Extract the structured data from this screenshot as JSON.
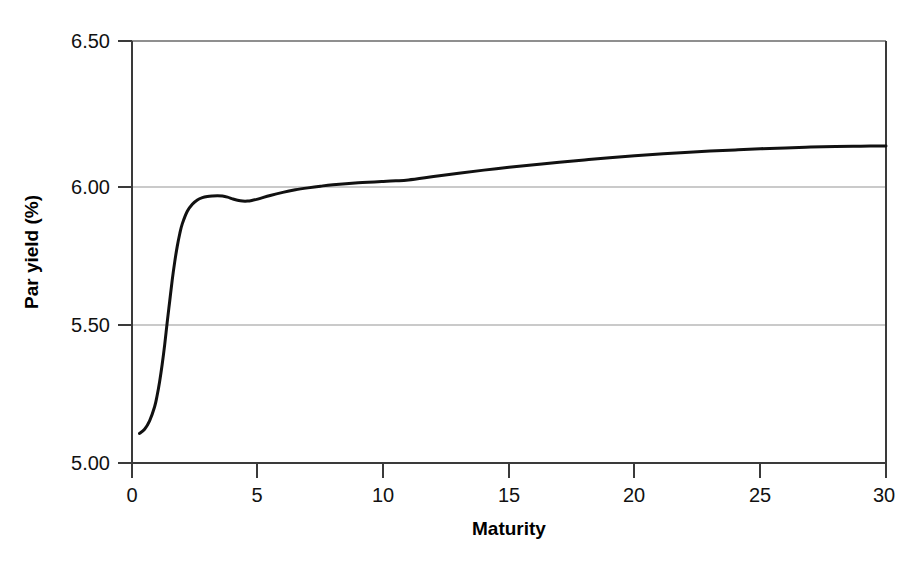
{
  "chart_data": {
    "type": "line",
    "title": "",
    "xlabel": "Maturity",
    "ylabel": "Par yield (%)",
    "xlim": [
      0,
      30
    ],
    "ylim": [
      5.0,
      6.5
    ],
    "xticks": [
      0,
      5,
      10,
      15,
      20,
      25,
      30
    ],
    "xtick_labels": [
      "0",
      "5",
      "10",
      "15",
      "20",
      "25",
      "30"
    ],
    "yticks": [
      5.0,
      5.5,
      6.0,
      6.5
    ],
    "ytick_labels": [
      "5.00",
      "5.50",
      "6.00",
      "6.50"
    ],
    "grid": "horizontal",
    "gridlines_at": [
      5.5,
      6.0
    ],
    "legend": "none",
    "line_color": "#111111",
    "line_width": 3,
    "series": [
      {
        "name": "Par yield curve",
        "x": [
          0.3,
          0.5,
          0.7,
          0.9,
          1.0,
          1.1,
          1.2,
          1.3,
          1.4,
          1.5,
          1.6,
          1.7,
          1.8,
          1.9,
          2.0,
          2.2,
          2.4,
          2.6,
          2.8,
          3.0,
          3.2,
          3.4,
          3.6,
          3.8,
          4.0,
          4.2,
          4.4,
          4.6,
          4.8,
          5.0,
          5.5,
          6.0,
          6.5,
          7.0,
          7.5,
          8.0,
          9.0,
          10.0,
          10.5,
          11.0,
          12.0,
          13.0,
          14.0,
          15.0,
          16.0,
          17.0,
          18.0,
          19.0,
          20.0,
          21.0,
          22.0,
          23.0,
          24.0,
          25.0,
          26.0,
          27.0,
          28.0,
          29.0,
          30.0
        ],
        "y": [
          5.105,
          5.12,
          5.15,
          5.2,
          5.24,
          5.29,
          5.35,
          5.42,
          5.5,
          5.575,
          5.65,
          5.715,
          5.77,
          5.815,
          5.85,
          5.895,
          5.92,
          5.935,
          5.943,
          5.947,
          5.949,
          5.95,
          5.949,
          5.945,
          5.939,
          5.934,
          5.931,
          5.931,
          5.934,
          5.938,
          5.951,
          5.962,
          5.971,
          5.978,
          5.984,
          5.989,
          5.996,
          6.001,
          6.003,
          6.006,
          6.018,
          6.03,
          6.041,
          6.051,
          6.06,
          6.069,
          6.077,
          6.085,
          6.092,
          6.098,
          6.104,
          6.109,
          6.113,
          6.117,
          6.12,
          6.123,
          6.125,
          6.126,
          6.127
        ]
      }
    ]
  },
  "axes": {
    "x_title": "Maturity",
    "y_title": "Par yield (%)",
    "x_tick_labels": [
      "0",
      "5",
      "10",
      "15",
      "20",
      "25",
      "30"
    ],
    "y_tick_labels": [
      "5.00",
      "5.50",
      "6.00",
      "6.50"
    ]
  },
  "style": {
    "background": "#ffffff",
    "axis_color": "#3a3a3a",
    "grid_color": "#b8b8b8",
    "line_color": "#111111"
  }
}
